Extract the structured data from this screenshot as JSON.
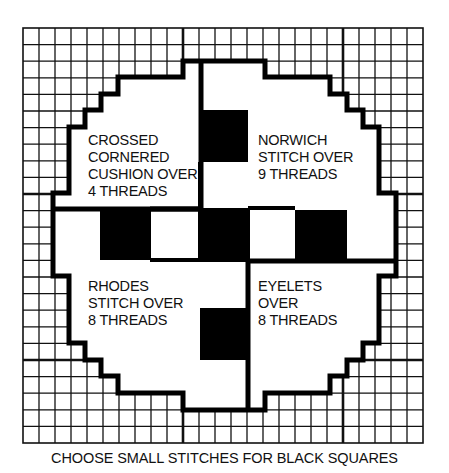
{
  "diagram": {
    "type": "needlepoint-chart",
    "grid": {
      "columns": 25,
      "rows": 25,
      "heavy_line_every": 10
    },
    "colors": {
      "line": "#111111",
      "background": "#ffffff",
      "fill": "#000000"
    },
    "quadrants": [
      {
        "position": "top-left",
        "lines": [
          "CROSSED",
          "CORNERED",
          "CUSHION OVER",
          "4 THREADS"
        ]
      },
      {
        "position": "top-right",
        "lines": [
          "NORWICH",
          "STITCH OVER",
          "9 THREADS"
        ]
      },
      {
        "position": "bottom-left",
        "lines": [
          "RHODES",
          "STITCH OVER",
          "8 THREADS"
        ]
      },
      {
        "position": "bottom-right",
        "lines": [
          "EYELETS",
          "OVER",
          "8 THREADS"
        ]
      }
    ],
    "quadrant_text": {
      "top_left": "CROSSED\nCORNERED\nCUSHION OVER\n4 THREADS",
      "top_right": "NORWICH\nSTITCH OVER\n9 THREADS",
      "bottom_left": "RHODES\nSTITCH OVER\n8 THREADS",
      "bottom_right": "EYELETS\nOVER\n8 THREADS"
    },
    "black_squares": 5,
    "caption": "CHOOSE SMALL STITCHES FOR BLACK SQUARES"
  }
}
